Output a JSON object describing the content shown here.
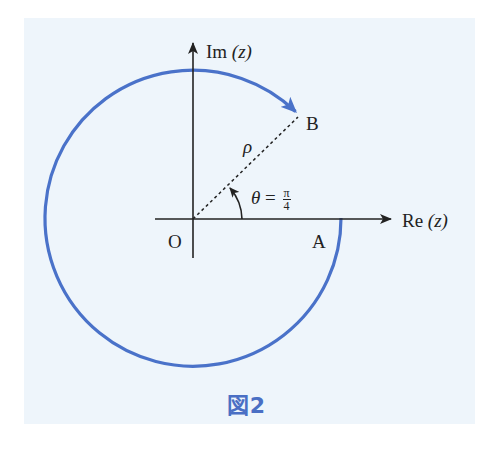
{
  "figure": {
    "caption": "図2",
    "background_color": "#eef5fb",
    "curve_color": "#4a72c9",
    "axis_color": "#222222"
  },
  "axes": {
    "real_label_prefix": "Re",
    "real_label_var": "(z)",
    "imag_label_prefix": "Im",
    "imag_label_var": "(z)"
  },
  "points": {
    "origin": "O",
    "a": "A",
    "b": "B"
  },
  "annotations": {
    "radius": "ρ",
    "theta_symbol": "θ",
    "equals": "=",
    "theta_num": "π",
    "theta_den": "4"
  }
}
